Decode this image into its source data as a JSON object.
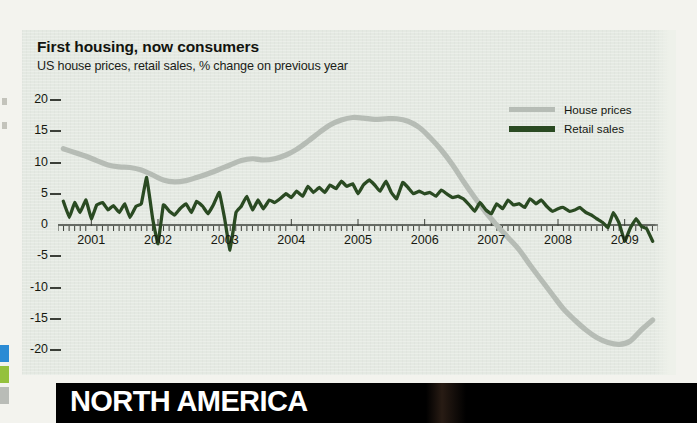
{
  "chart_data": {
    "type": "line",
    "title": "First housing, now consumers",
    "subtitle": "US house prices, retail sales, % change on previous year",
    "xlabel": "",
    "ylabel": "",
    "ylim": [
      -20,
      20
    ],
    "xlim": [
      2000.5,
      2009.5
    ],
    "grid": false,
    "legend_position": "top-right",
    "ytick_labels": [
      "20",
      "15",
      "10",
      "5",
      "0",
      "-5",
      "-10",
      "-15",
      "-20"
    ],
    "ytick_values": [
      20,
      15,
      10,
      5,
      0,
      -5,
      -10,
      -15,
      -20
    ],
    "xtick_labels": [
      "2001",
      "2002",
      "2003",
      "2004",
      "2005",
      "2006",
      "2007",
      "2008",
      "2009"
    ],
    "xtick_values": [
      2001,
      2002,
      2003,
      2004,
      2005,
      2006,
      2007,
      2008,
      2009
    ],
    "colors": {
      "house_prices": "#b6bcb5",
      "retail_sales": "#2a4a22",
      "panel_background": "#e4e9e2",
      "page_background": "#f3f3ee",
      "axis": "#3b3f38",
      "banner_background": "#000000",
      "banner_text": "#ffffff"
    },
    "series": [
      {
        "name": "House prices",
        "color": "#b6bcb5",
        "x": [
          2000.58,
          2000.75,
          2000.92,
          2001.08,
          2001.25,
          2001.42,
          2001.58,
          2001.75,
          2001.92,
          2002.08,
          2002.25,
          2002.42,
          2002.58,
          2002.75,
          2002.92,
          2003.08,
          2003.25,
          2003.42,
          2003.58,
          2003.75,
          2003.92,
          2004.08,
          2004.25,
          2004.42,
          2004.58,
          2004.75,
          2004.92,
          2005.08,
          2005.25,
          2005.42,
          2005.58,
          2005.75,
          2005.92,
          2006.08,
          2006.25,
          2006.42,
          2006.58,
          2006.75,
          2006.92,
          2007.08,
          2007.25,
          2007.42,
          2007.58,
          2007.75,
          2007.92,
          2008.08,
          2008.25,
          2008.42,
          2008.58,
          2008.75,
          2008.92,
          2009.08,
          2009.25,
          2009.42
        ],
        "values": [
          12.2,
          11.6,
          11.0,
          10.3,
          9.6,
          9.3,
          9.2,
          8.8,
          8.0,
          7.2,
          6.9,
          7.1,
          7.6,
          8.2,
          8.9,
          9.6,
          10.3,
          10.6,
          10.4,
          10.6,
          11.2,
          12.1,
          13.4,
          14.8,
          16.0,
          16.8,
          17.2,
          17.1,
          16.9,
          17.0,
          17.0,
          16.6,
          15.6,
          14.0,
          12.0,
          9.6,
          7.0,
          4.4,
          2.0,
          0.0,
          -2.0,
          -4.0,
          -6.4,
          -8.8,
          -11.2,
          -13.4,
          -15.2,
          -16.8,
          -18.0,
          -18.8,
          -19.1,
          -18.6,
          -16.8,
          -15.2
        ]
      },
      {
        "name": "Retail sales",
        "color": "#2a4a22",
        "x": [
          2000.58,
          2000.67,
          2000.75,
          2000.83,
          2000.92,
          2001.0,
          2001.08,
          2001.17,
          2001.25,
          2001.33,
          2001.42,
          2001.5,
          2001.58,
          2001.67,
          2001.75,
          2001.83,
          2001.92,
          2002.0,
          2002.08,
          2002.17,
          2002.25,
          2002.33,
          2002.42,
          2002.5,
          2002.58,
          2002.67,
          2002.75,
          2002.83,
          2002.92,
          2003.0,
          2003.08,
          2003.17,
          2003.25,
          2003.33,
          2003.42,
          2003.5,
          2003.58,
          2003.67,
          2003.75,
          2003.83,
          2003.92,
          2004.0,
          2004.08,
          2004.17,
          2004.25,
          2004.33,
          2004.42,
          2004.5,
          2004.58,
          2004.67,
          2004.75,
          2004.83,
          2004.92,
          2005.0,
          2005.08,
          2005.17,
          2005.25,
          2005.33,
          2005.42,
          2005.5,
          2005.58,
          2005.67,
          2005.75,
          2005.83,
          2005.92,
          2006.0,
          2006.08,
          2006.17,
          2006.25,
          2006.33,
          2006.42,
          2006.5,
          2006.58,
          2006.67,
          2006.75,
          2006.83,
          2006.92,
          2007.0,
          2007.08,
          2007.17,
          2007.25,
          2007.33,
          2007.42,
          2007.5,
          2007.58,
          2007.67,
          2007.75,
          2007.83,
          2007.92,
          2008.0,
          2008.08,
          2008.17,
          2008.25,
          2008.33,
          2008.42,
          2008.5,
          2008.58,
          2008.67,
          2008.75,
          2008.83,
          2008.92,
          2009.0,
          2009.08,
          2009.17,
          2009.25,
          2009.33,
          2009.42
        ],
        "values": [
          3.8,
          1.2,
          3.6,
          2.0,
          4.0,
          1.0,
          3.2,
          3.6,
          2.4,
          3.1,
          2.0,
          3.4,
          1.2,
          3.0,
          3.4,
          7.6,
          1.0,
          -3.0,
          3.2,
          2.2,
          1.6,
          2.6,
          3.4,
          2.0,
          3.8,
          3.0,
          1.8,
          3.2,
          5.2,
          1.0,
          -4.0,
          2.0,
          3.0,
          4.6,
          2.4,
          4.0,
          2.6,
          4.0,
          3.6,
          4.2,
          5.0,
          4.4,
          5.4,
          4.6,
          6.2,
          5.2,
          6.0,
          5.2,
          6.4,
          5.8,
          7.0,
          6.2,
          6.6,
          5.0,
          6.4,
          7.2,
          6.4,
          5.4,
          7.0,
          5.2,
          4.2,
          6.8,
          6.0,
          5.0,
          5.4,
          5.0,
          5.2,
          4.6,
          5.6,
          5.0,
          4.4,
          4.6,
          4.2,
          3.2,
          2.2,
          3.6,
          2.4,
          1.8,
          3.4,
          2.6,
          4.0,
          3.2,
          3.4,
          2.8,
          4.2,
          3.4,
          4.0,
          3.0,
          2.2,
          2.6,
          2.8,
          2.2,
          2.4,
          2.8,
          2.0,
          1.6,
          1.0,
          0.4,
          -0.4,
          2.0,
          0.2,
          -2.6,
          -0.6,
          1.0,
          -0.2,
          -0.6,
          -2.6
        ]
      }
    ]
  },
  "legend": {
    "items": [
      {
        "label": "House prices"
      },
      {
        "label": "Retail sales"
      }
    ]
  },
  "banner": {
    "text": "NORTH AMERICA"
  }
}
